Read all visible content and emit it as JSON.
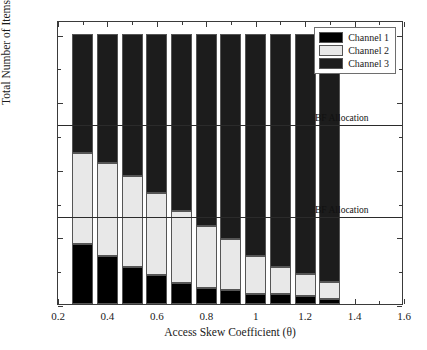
{
  "chart_data": {
    "type": "bar",
    "stacked": true,
    "title": "",
    "xlabel": "Access Skew Coefficient (θ)",
    "ylabel": "Total Number of Items (D)",
    "xlim": [
      0.2,
      1.6
    ],
    "ylim": [
      0,
      2100
    ],
    "xticks": [
      0.2,
      0.4,
      0.6,
      0.8,
      1,
      1.2,
      1.4,
      1.6
    ],
    "xticklabels": [
      "0.2",
      "0.4",
      "0.6",
      "0.8",
      "1",
      "1.2",
      "1.4",
      "1.6"
    ],
    "xticks_minor": [
      0.3,
      0.5,
      0.7,
      0.9,
      1.1,
      1.3,
      1.5
    ],
    "yticks": [
      0,
      500,
      1000,
      1500,
      2000
    ],
    "yticklabels": [
      "0",
      "500",
      "1000",
      "1500",
      "2000"
    ],
    "yticks_minor": [
      250,
      750,
      1250,
      1750
    ],
    "grid": false,
    "bar_width": 0.085,
    "categories": [
      0.3,
      0.4,
      0.5,
      0.6,
      0.7,
      0.8,
      0.9,
      1.0,
      1.1,
      1.2,
      1.3
    ],
    "series": [
      {
        "name": "Channel 1",
        "color": "#000000",
        "values": [
          440,
          355,
          275,
          218,
          158,
          118,
          100,
          76,
          76,
          56,
          38
        ]
      },
      {
        "name": "Channel 2",
        "color": "#e8e8e8",
        "values": [
          675,
          690,
          670,
          600,
          533,
          458,
          377,
          280,
          200,
          163,
          124
        ]
      },
      {
        "name": "Channel 3",
        "color": "#1c1c1c",
        "values": [
          885,
          955,
          1055,
          1182,
          1309,
          1424,
          1523,
          1644,
          1724,
          1781,
          1838
        ]
      }
    ],
    "series_totals": [
      2000,
      2000,
      2000,
      2000,
      2000,
      2000,
      2000,
      2000,
      2000,
      2000,
      2000
    ],
    "reference_lines": [
      {
        "label": "BF Allocation",
        "value": 1340,
        "label_x": 1.24,
        "label_dy": -12
      },
      {
        "label": "BF Allocation",
        "value": 660,
        "label_x": 1.24,
        "label_dy": -12
      }
    ],
    "legend": {
      "position": "top-right",
      "entries": [
        {
          "label": "Channel 1",
          "color": "#000000"
        },
        {
          "label": "Channel 2",
          "color": "#e8e8e8"
        },
        {
          "label": "Channel 3",
          "color": "#1c1c1c"
        }
      ]
    }
  }
}
